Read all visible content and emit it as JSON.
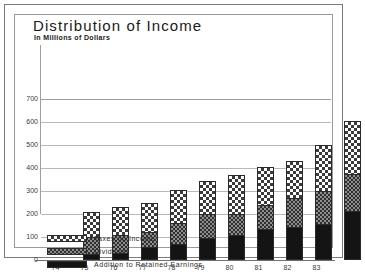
{
  "chart_data": {
    "type": "bar",
    "stacked": true,
    "title": "Distribution of Income",
    "subtitle": "In Millions of Dollars",
    "xlabel": "",
    "ylabel": "",
    "ylim": [
      0,
      700
    ],
    "yticks": [
      0,
      100,
      200,
      300,
      400,
      500,
      600,
      700
    ],
    "grid": true,
    "legend_position": "bottom-left",
    "categories": [
      "74",
      "75",
      "76",
      "77",
      "78",
      "79",
      "80",
      "81",
      "82",
      "83"
    ],
    "series": [
      {
        "name": "Addition to Retained Earnings",
        "key": "retained",
        "color": "#141414",
        "pattern": "solid-black",
        "values": [
          25,
          30,
          55,
          70,
          95,
          110,
          135,
          145,
          155,
          215
        ]
      },
      {
        "name": "Dividends",
        "key": "dividends",
        "color": "#8d8d8d",
        "pattern": "fine-checker-gray",
        "values": [
          75,
          80,
          65,
          90,
          105,
          90,
          105,
          125,
          145,
          160
        ]
      },
      {
        "name": "Taxes on Income",
        "key": "taxes",
        "color": "#ffffff",
        "pattern": "coarse-checker-white",
        "values": [
          110,
          120,
          130,
          145,
          145,
          170,
          165,
          160,
          200,
          230
        ]
      }
    ],
    "totals": [
      210,
      230,
      250,
      305,
      345,
      370,
      405,
      430,
      500,
      605
    ]
  },
  "legend": [
    {
      "label": "Taxes on Income",
      "swatch": "taxes"
    },
    {
      "label": "Dividends",
      "swatch": "dividends"
    },
    {
      "label": "Addition to Retained Earnings",
      "swatch": "retained"
    }
  ],
  "colors": {
    "frame_border": "#7a7a7a",
    "inner_border": "#9a9a9a",
    "gridline": "#b9b9b9",
    "axis": "#6f6f6f",
    "text": "#1a1a1a"
  }
}
